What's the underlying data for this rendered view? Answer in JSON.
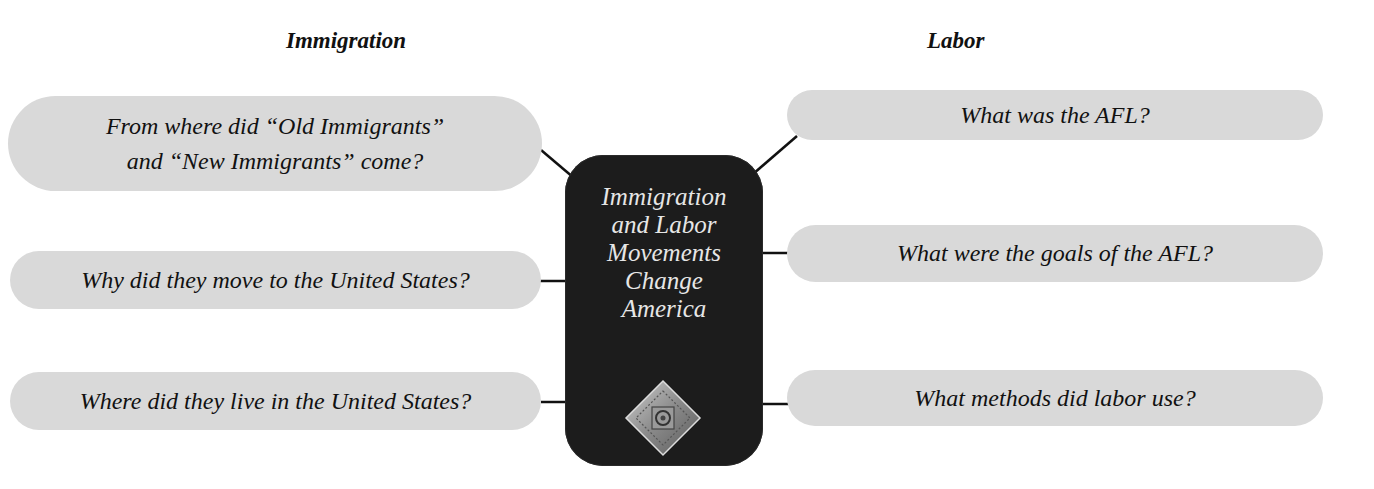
{
  "headings": {
    "left": "Immigration",
    "right": "Labor"
  },
  "center": {
    "title_lines": [
      "Immigration",
      "and Labor",
      "Movements",
      "Change",
      "America"
    ],
    "emblem_icon": "ornamental-diamond-emblem",
    "background_color": "#1c1c1c",
    "text_color": "#e6e6e6"
  },
  "left_questions": [
    {
      "line1": "From where did “Old Immigrants”",
      "line2": "and “New Immigrants” come?"
    },
    {
      "text": "Why did they move to the United States?"
    },
    {
      "text": "Where did they live in the United States?"
    }
  ],
  "right_questions": [
    {
      "text": "What was the AFL?"
    },
    {
      "text": "What were the goals of the AFL?"
    },
    {
      "text": "What methods did labor use?"
    }
  ],
  "colors": {
    "pill": "#d9d9d9",
    "connector": "#111111"
  }
}
